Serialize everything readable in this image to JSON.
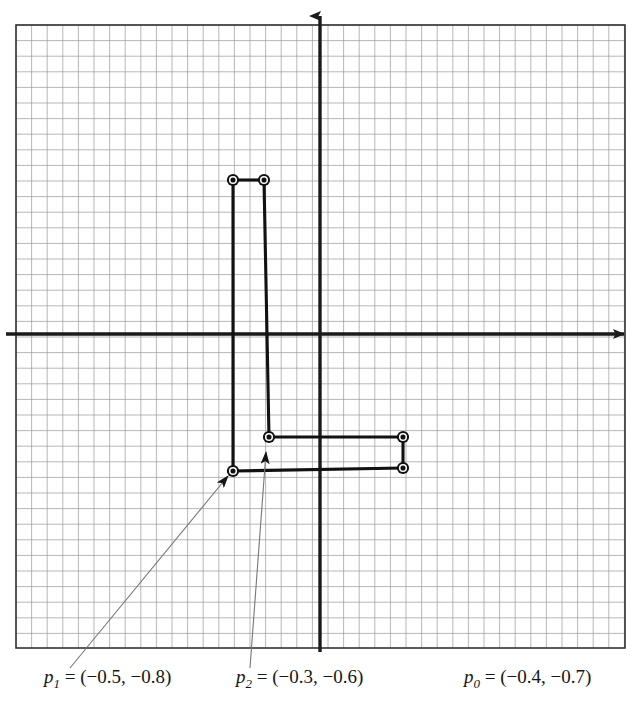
{
  "figure": {
    "type": "coordinate-grid-diagram",
    "background_color": "#ffffff",
    "grid": {
      "minor_color": "#8a8a8a",
      "major_color": "#3d3d3d",
      "border_color": "#2b2b2b",
      "minor_spacing_px": 15.6,
      "major_every": 3,
      "left_px": 16,
      "top_px": 25,
      "right_px": 625,
      "bottom_px": 648,
      "cols": 39,
      "rows": 40
    },
    "axes": {
      "color": "#1a1a1a",
      "origin_x_px": 320,
      "origin_y_px": 334,
      "x_axis_label": "",
      "y_axis_label": "",
      "x_arrow": "right-arrow-icon",
      "y_arrow": "up-arrow-icon"
    },
    "series_color": "#111111"
  },
  "chart_data": {
    "type": "scatter",
    "title": "",
    "xlabel": "",
    "ylabel": "",
    "grid": true,
    "legend_position": "below-plot",
    "units_per_cell": 0.1,
    "xlim": [
      -3.1,
      3.0
    ],
    "ylim": [
      -2.0,
      2.0
    ],
    "points": [
      {
        "name": "p0-upper",
        "label": "p0",
        "x": 0.53,
        "y": -0.66,
        "px": 403,
        "py": 437
      },
      {
        "name": "p0-lower",
        "label": "p0",
        "x": 0.53,
        "y": -0.86,
        "px": 403,
        "py": 468
      },
      {
        "name": "p1-upper",
        "label": "p1",
        "x": -0.56,
        "y": 0.99,
        "px": 233,
        "py": 180
      },
      {
        "name": "p1-lower",
        "label": "p1",
        "x": -0.56,
        "y": -0.88,
        "px": 233,
        "py": 471
      },
      {
        "name": "p2-upper",
        "label": "p2",
        "x": -0.36,
        "y": 0.99,
        "px": 264,
        "py": 180
      },
      {
        "name": "p2-lower",
        "label": "p2",
        "x": -0.33,
        "y": -0.66,
        "px": 269,
        "py": 437
      }
    ],
    "connectors": [
      {
        "from": "p1-upper",
        "to": "p2-upper"
      },
      {
        "from": "p1-upper",
        "to": "p1-lower"
      },
      {
        "from": "p2-upper",
        "to": "p2-lower"
      },
      {
        "from": "p2-lower",
        "to": "p0-upper"
      },
      {
        "from": "p0-upper",
        "to": "p0-lower"
      },
      {
        "from": "p0-lower",
        "to": "p1-lower"
      }
    ]
  },
  "labels": {
    "p1": {
      "var": "p",
      "sub": "1",
      "rest": " = (−0.5, −0.8)",
      "full": "p1 = (−0.5, −0.8)"
    },
    "p2": {
      "var": "p",
      "sub": "2",
      "rest": " = (−0.3, −0.6)",
      "full": "p2 = (−0.3, −0.6)"
    },
    "p0": {
      "var": "p",
      "sub": "0",
      "rest": " = (−0.4, −0.7)",
      "full": "p0 = (−0.4, −0.7)"
    }
  },
  "leaders": [
    {
      "name": "leader-p1",
      "from_px": [
        70,
        668
      ],
      "to_px": [
        228,
        476
      ],
      "target": "p1-lower"
    },
    {
      "name": "leader-p2",
      "from_px": [
        250,
        668
      ],
      "to_px": [
        266,
        452
      ],
      "target": "p2-lower"
    }
  ]
}
